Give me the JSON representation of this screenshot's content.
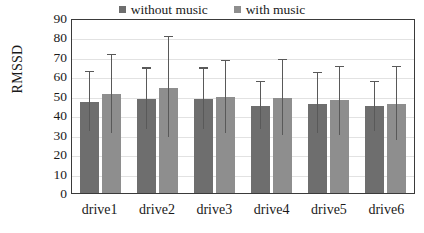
{
  "chart_data": {
    "type": "bar",
    "title": "",
    "xlabel": "",
    "ylabel": "RMSSD",
    "ylim": [
      0,
      90
    ],
    "ytick_step": 10,
    "yticks": [
      90,
      80,
      70,
      60,
      50,
      40,
      30,
      20,
      10,
      0
    ],
    "grid": true,
    "legend_position": "top-center",
    "error_bars": "asymmetric-range",
    "categories": [
      "drive1",
      "drive2",
      "drive3",
      "drive4",
      "drive5",
      "drive6"
    ],
    "series": [
      {
        "name": "without music",
        "color": "#6e6e6e",
        "values": [
          47,
          48.5,
          48.5,
          45,
          46,
          44.5
        ],
        "err_upper": [
          62,
          64,
          64,
          57,
          61.5,
          57
        ],
        "err_lower": [
          32,
          33,
          33,
          33,
          31,
          32
        ]
      },
      {
        "name": "with music",
        "color": "#8e8e8e",
        "values": [
          51,
          54,
          49.5,
          49,
          48,
          46
        ],
        "err_upper": [
          71,
          80,
          68,
          68.5,
          65,
          65
        ],
        "err_lower": [
          31,
          29,
          31,
          30,
          30,
          27.5
        ]
      }
    ]
  },
  "legend": {
    "items": [
      {
        "label": "without music",
        "color": "#6e6e6e"
      },
      {
        "label": "with music",
        "color": "#8e8e8e"
      }
    ]
  },
  "axes": {
    "y_title": "RMSSD"
  }
}
